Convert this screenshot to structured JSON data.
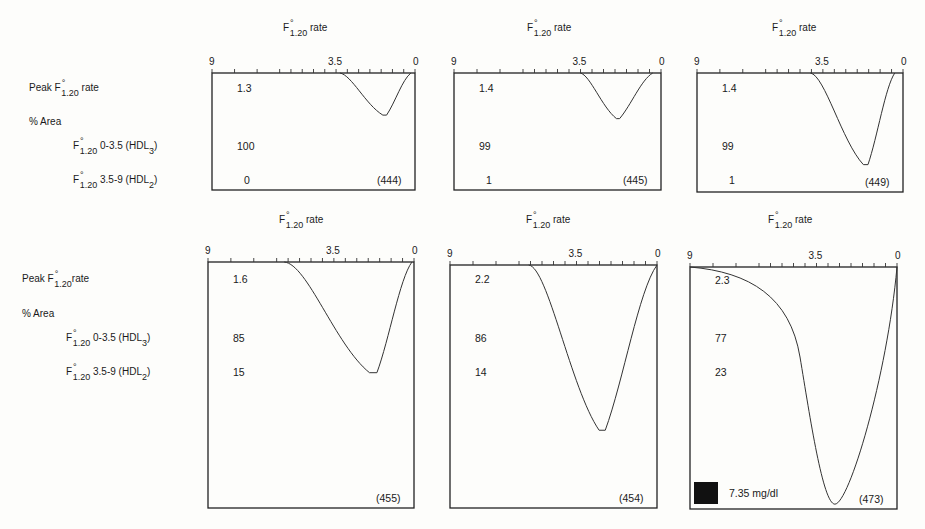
{
  "row_labels": {
    "peak_prefix": "Peak F",
    "peak_suffix": "rate",
    "area": "% Area",
    "hdl3_prefix": "F",
    "hdl3_range": "0-3.5 (HDL",
    "hdl3_sub": "3",
    "hdl2_prefix": "F",
    "hdl2_range": "3.5-9 (HDL",
    "hdl2_sub": "2",
    "f_sub": "1.20",
    "degree": "°",
    "close_paren": ")"
  },
  "panel_header": {
    "f": "F",
    "sub": "1.20",
    "rate": "rate",
    "degree": "°"
  },
  "axis_ticks": {
    "left": "9",
    "mid": "3.5",
    "right": "0"
  },
  "panels": [
    {
      "id": "444",
      "label": "(444)",
      "peak": "1.3",
      "hdl3": "100",
      "hdl2": "0"
    },
    {
      "id": "445",
      "label": "(445)",
      "peak": "1.4",
      "hdl3": "99",
      "hdl2": "1"
    },
    {
      "id": "449",
      "label": "(449)",
      "peak": "1.4",
      "hdl3": "99",
      "hdl2": "1"
    },
    {
      "id": "455",
      "label": "(455)",
      "peak": "1.6",
      "hdl3": "85",
      "hdl2": "15"
    },
    {
      "id": "454",
      "label": "(454)",
      "peak": "2.2",
      "hdl3": "86",
      "hdl2": "14"
    },
    {
      "id": "473",
      "label": "(473)",
      "peak": "2.3",
      "hdl3": "77",
      "hdl2": "23"
    }
  ],
  "scale_legend": {
    "label": "7.35 mg/dl",
    "swatch_color": "#111111"
  },
  "chart_data": {
    "type": "line",
    "xlabel": "F°1.20 rate",
    "x_axis_reversed": true,
    "xlim": [
      9,
      0
    ],
    "x_ticks": [
      9,
      3.5,
      0
    ],
    "legend": "filled square = 7.35 mg/dl",
    "series": [
      {
        "name": "(444)",
        "peak_rate": 1.3,
        "pct_hdl3_0_3.5": 100,
        "pct_hdl2_3.5_9": 0,
        "curve_start": 3.3,
        "curve_min_x": 1.3,
        "relative_depth": 0.33
      },
      {
        "name": "(445)",
        "peak_rate": 1.4,
        "pct_hdl3_0_3.5": 99,
        "pct_hdl2_3.5_9": 1,
        "curve_start": 3.6,
        "curve_min_x": 1.4,
        "relative_depth": 0.37
      },
      {
        "name": "(449)",
        "peak_rate": 1.4,
        "pct_hdl3_0_3.5": 99,
        "pct_hdl2_3.5_9": 1,
        "curve_start": 4.1,
        "curve_min_x": 1.4,
        "relative_depth": 0.73
      },
      {
        "name": "(455)",
        "peak_rate": 1.6,
        "pct_hdl3_0_3.5": 85,
        "pct_hdl2_3.5_9": 15,
        "curve_start": 5.7,
        "curve_min_x": 1.6,
        "relative_depth": 0.44
      },
      {
        "name": "(454)",
        "peak_rate": 2.2,
        "pct_hdl3_0_3.5": 86,
        "pct_hdl2_3.5_9": 14,
        "curve_start": 5.4,
        "curve_min_x": 2.2,
        "relative_depth": 0.69
      },
      {
        "name": "(473)",
        "peak_rate": 2.3,
        "pct_hdl3_0_3.5": 77,
        "pct_hdl2_3.5_9": 23,
        "curve_start": 9.0,
        "curve_min_x": 2.3,
        "relative_depth": 1.0
      }
    ]
  }
}
